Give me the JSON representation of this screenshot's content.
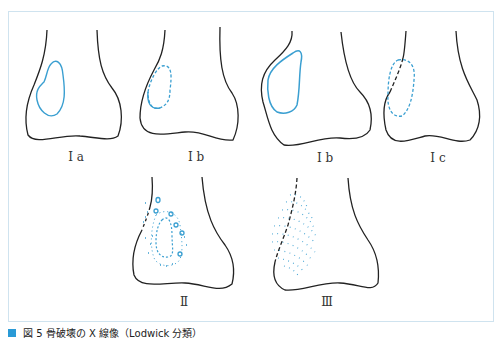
{
  "figure": {
    "panels": [
      {
        "id": "Ia",
        "label": "I a"
      },
      {
        "id": "Ib-1",
        "label": "I b"
      },
      {
        "id": "Ib-2",
        "label": "I b"
      },
      {
        "id": "Ic",
        "label": "I c"
      },
      {
        "id": "II",
        "label": "Ⅱ"
      },
      {
        "id": "III",
        "label": "Ⅲ"
      }
    ],
    "colors": {
      "outline": "#222222",
      "lesion": "#3a9fd1",
      "frame": "#cfe3ef"
    }
  },
  "caption": {
    "text": "図 5 骨破壊の X 線像（Lodwick 分類）"
  }
}
